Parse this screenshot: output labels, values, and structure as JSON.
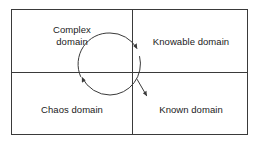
{
  "diagram": {
    "type": "cynefin-framework-quadrant-diagram",
    "title": "",
    "background_color": "#ffffff",
    "line_color": "#3a3a3a",
    "text_color": "#1a1a1a",
    "frame": {
      "x": 11,
      "y": 9,
      "width": 237,
      "height": 126,
      "stroke_width": 1
    },
    "dividers": {
      "vertical_x": 132.5,
      "horizontal_y": 72.5,
      "stroke_width": 1
    },
    "quadrants": [
      {
        "id": "complex",
        "position": "top-left",
        "label_lines": [
          "Complex",
          "domain"
        ],
        "label_line1": "Complex",
        "label_line2": "domain"
      },
      {
        "id": "knowable",
        "position": "top-right",
        "label_lines": [
          "Knowable domain"
        ],
        "label_line1": "Knowable domain",
        "label_line2": ""
      },
      {
        "id": "chaos",
        "position": "bottom-left",
        "label_lines": [
          "Chaos domain"
        ],
        "label_line1": "Chaos domain",
        "label_line2": ""
      },
      {
        "id": "known",
        "position": "bottom-right",
        "label_lines": [
          "Known domain"
        ],
        "label_line1": "Known domain",
        "label_line2": ""
      }
    ],
    "flow_arrow": {
      "shape": "open-circle-counterclockwise",
      "center_x": 110,
      "center_y": 64,
      "radius": 31,
      "stroke_width": 1,
      "arrowheads": [
        {
          "id": "arrowhead-upper-right",
          "x": 137,
          "y": 46,
          "direction": "down-right"
        },
        {
          "id": "arrowhead-left",
          "x": 80,
          "y": 79,
          "direction": "up-left"
        }
      ]
    },
    "exit_arrow": {
      "id": "exit-arrow-to-known",
      "from_x": 138,
      "from_y": 78,
      "to_x": 148,
      "to_y": 97,
      "direction": "down-right",
      "stroke_width": 1
    }
  }
}
